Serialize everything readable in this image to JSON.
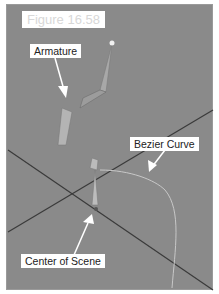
{
  "figure": {
    "title": "Figure 16.58",
    "labels": {
      "armature": "Armature",
      "bezier_curve": "Bezier Curve",
      "center_of_scene": "Center of Scene"
    }
  },
  "colors": {
    "viewport_bg": "#8a8a8a",
    "grid_line": "#3a3a3a",
    "bone": "#b0b0b0",
    "curve": "#c8c8c8",
    "label_bg": "#ffffff"
  }
}
